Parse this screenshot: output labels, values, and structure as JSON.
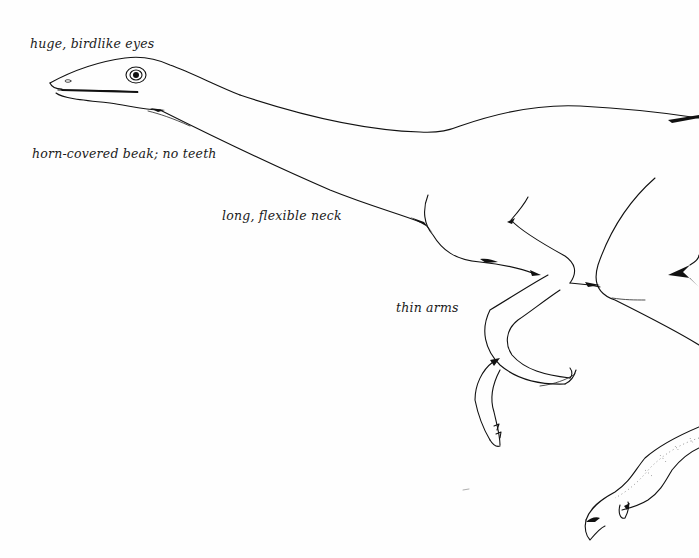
{
  "figure": {
    "type": "labeled anatomical illustration",
    "labels": [
      {
        "id": "eyes",
        "text": "huge, birdlike eyes"
      },
      {
        "id": "beak",
        "text": "horn-covered beak; no teeth"
      },
      {
        "id": "neck",
        "text": "long, flexible neck"
      },
      {
        "id": "arms",
        "text": "thin arms"
      }
    ],
    "colors": {
      "background": "#fefefe",
      "ink": "#111111"
    }
  }
}
